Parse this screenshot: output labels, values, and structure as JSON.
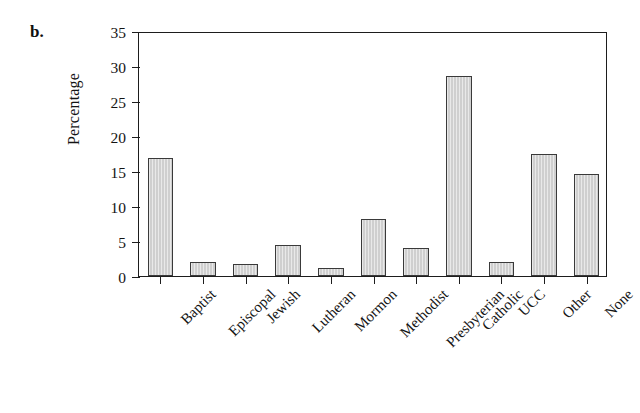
{
  "figure": {
    "panel_letter": "b.",
    "ylabel": "Percentage"
  },
  "chart_data": {
    "type": "bar",
    "title": "",
    "subtitle": "",
    "panel_label": "b.",
    "xlabel": "",
    "ylabel": "Percentage",
    "ylim": [
      0,
      35
    ],
    "yticks": [
      0,
      5,
      10,
      15,
      20,
      25,
      30,
      35
    ],
    "ytick_labels": [
      "0",
      "5",
      "10",
      "15",
      "20",
      "25",
      "30",
      "35"
    ],
    "grid": false,
    "legend": null,
    "bar_fill_color": "#cfcfcf",
    "bar_edge_color": "#3a3a3a",
    "axis_color": "#1d1d1d",
    "categories": [
      "Baptist",
      "Episcopal",
      "Jewish",
      "Lutheran",
      "Mormon",
      "Methodist",
      "Presbyterian",
      "Catholic",
      "UCC",
      "Other",
      "None"
    ],
    "values": [
      16.8,
      2.0,
      1.7,
      4.4,
      1.2,
      8.1,
      4.0,
      28.6,
      2.0,
      17.5,
      14.6
    ]
  }
}
